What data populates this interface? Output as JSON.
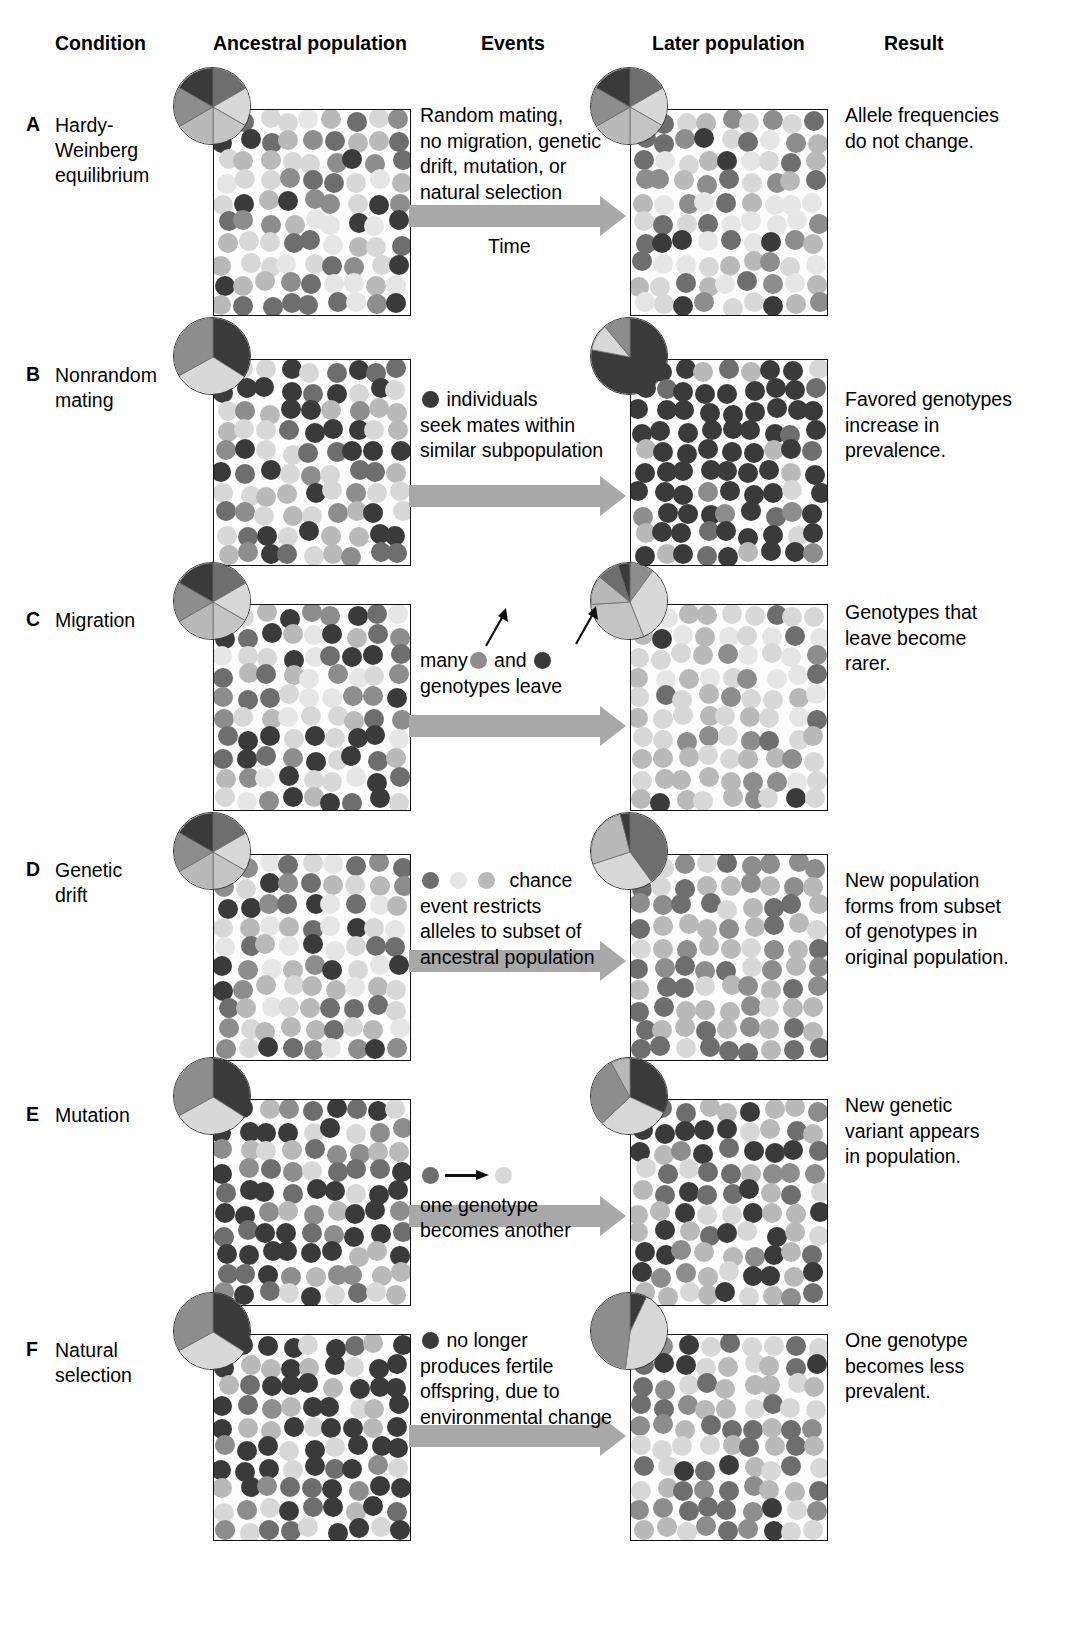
{
  "figure": {
    "columns": [
      {
        "id": "condition",
        "label": "Condition"
      },
      {
        "id": "ancestral",
        "label": "Ancestral population"
      },
      {
        "id": "events",
        "label": "Events"
      },
      {
        "id": "later",
        "label": "Later population"
      },
      {
        "id": "result",
        "label": "Result"
      }
    ]
  },
  "palette": {
    "very_dark": "#3a3a3a",
    "dark": "#555555",
    "mid_dark": "#6e6e6e",
    "mid": "#8d8d8d",
    "light": "#b9b9b9",
    "very_light": "#d8d8d8",
    "pale": "#e6e6e6",
    "arrow_gray": "#a8a8a8",
    "box_border": "#111111",
    "background": "#ffffff",
    "text": "#000000"
  },
  "rows": [
    {
      "letter": "A",
      "condition": "Hardy-\nWeinberg\nequilibrium",
      "events": "Random mating,\nno migration, genetic\ndrift, mutation, or\nnatural selection",
      "time_label": "Time",
      "result": "Allele frequencies\ndo not change.",
      "ancestral_pie": [
        {
          "color": "#6e6e6e",
          "fraction": 0.1667
        },
        {
          "color": "#d8d8d8",
          "fraction": 0.1667
        },
        {
          "color": "#c4c4c4",
          "fraction": 0.1667
        },
        {
          "color": "#b9b9b9",
          "fraction": 0.1667
        },
        {
          "color": "#8d8d8d",
          "fraction": 0.1667
        },
        {
          "color": "#3a3a3a",
          "fraction": 0.1667
        }
      ],
      "later_pie": [
        {
          "color": "#6e6e6e",
          "fraction": 0.1667
        },
        {
          "color": "#d8d8d8",
          "fraction": 0.1667
        },
        {
          "color": "#c4c4c4",
          "fraction": 0.1667
        },
        {
          "color": "#b9b9b9",
          "fraction": 0.1667
        },
        {
          "color": "#8d8d8d",
          "fraction": 0.1667
        },
        {
          "color": "#3a3a3a",
          "fraction": 0.1667
        }
      ],
      "ancestral_mix": {
        "#3a3a3a": 0.16,
        "#6e6e6e": 0.17,
        "#8d8d8d": 0.17,
        "#b9b9b9": 0.17,
        "#d8d8d8": 0.17,
        "#e6e6e6": 0.16
      },
      "later_mix": {
        "#3a3a3a": 0.16,
        "#6e6e6e": 0.17,
        "#8d8d8d": 0.17,
        "#b9b9b9": 0.17,
        "#d8d8d8": 0.17,
        "#e6e6e6": 0.16
      },
      "seed_a": 11,
      "seed_b": 29
    },
    {
      "letter": "B",
      "condition": "Nonrandom\nmating",
      "events_prefix_dot": "#3a3a3a",
      "events": "individuals\nseek mates within\nsimilar subpopulation",
      "result": "Favored genotypes\nincrease in\nprevalence.",
      "ancestral_pie": [
        {
          "color": "#3a3a3a",
          "fraction": 0.34
        },
        {
          "color": "#d8d8d8",
          "fraction": 0.33
        },
        {
          "color": "#8d8d8d",
          "fraction": 0.33
        }
      ],
      "later_pie": [
        {
          "color": "#3a3a3a",
          "fraction": 0.78
        },
        {
          "color": "#d8d8d8",
          "fraction": 0.11
        },
        {
          "color": "#8d8d8d",
          "fraction": 0.11
        }
      ],
      "ancestral_mix": {
        "#3a3a3a": 0.4,
        "#6e6e6e": 0.18,
        "#8d8d8d": 0.12,
        "#b9b9b9": 0.15,
        "#d8d8d8": 0.15
      },
      "later_mix": {
        "#3a3a3a": 0.72,
        "#6e6e6e": 0.1,
        "#8d8d8d": 0.06,
        "#b9b9b9": 0.06,
        "#d8d8d8": 0.06
      },
      "seed_a": 5,
      "seed_b": 41
    },
    {
      "letter": "C",
      "condition": "Migration",
      "events_line1_a": "many",
      "events_line1_dot1": "#8d8d8d",
      "events_line1_b": "and",
      "events_line1_dot2": "#3a3a3a",
      "events": "genotypes leave",
      "result": "Genotypes that\nleave become\nrarer.",
      "ancestral_pie": [
        {
          "color": "#6e6e6e",
          "fraction": 0.1667
        },
        {
          "color": "#d8d8d8",
          "fraction": 0.1667
        },
        {
          "color": "#c4c4c4",
          "fraction": 0.1667
        },
        {
          "color": "#b9b9b9",
          "fraction": 0.1667
        },
        {
          "color": "#8d8d8d",
          "fraction": 0.1667
        },
        {
          "color": "#3a3a3a",
          "fraction": 0.1667
        }
      ],
      "later_pie": [
        {
          "color": "#8d8d8d",
          "fraction": 0.1
        },
        {
          "color": "#d8d8d8",
          "fraction": 0.34
        },
        {
          "color": "#c4c4c4",
          "fraction": 0.3
        },
        {
          "color": "#b9b9b9",
          "fraction": 0.12
        },
        {
          "color": "#6e6e6e",
          "fraction": 0.09
        },
        {
          "color": "#3a3a3a",
          "fraction": 0.05
        }
      ],
      "ancestral_mix": {
        "#3a3a3a": 0.16,
        "#6e6e6e": 0.17,
        "#8d8d8d": 0.17,
        "#b9b9b9": 0.17,
        "#d8d8d8": 0.17,
        "#e6e6e6": 0.16
      },
      "later_mix": {
        "#3a3a3a": 0.05,
        "#6e6e6e": 0.12,
        "#8d8d8d": 0.13,
        "#b9b9b9": 0.24,
        "#d8d8d8": 0.25,
        "#e6e6e6": 0.21
      },
      "seed_a": 17,
      "seed_b": 53
    },
    {
      "letter": "D",
      "condition": "Genetic\ndrift",
      "events_dots": [
        "#6e6e6e",
        "#e6e6e6",
        "#b9b9b9"
      ],
      "events": "chance\nevent restricts\nalleles to subset of\nancestral population",
      "result": "New population\nforms from subset\nof genotypes in\noriginal population.",
      "ancestral_pie": [
        {
          "color": "#6e6e6e",
          "fraction": 0.1667
        },
        {
          "color": "#d8d8d8",
          "fraction": 0.1667
        },
        {
          "color": "#c4c4c4",
          "fraction": 0.1667
        },
        {
          "color": "#b9b9b9",
          "fraction": 0.1667
        },
        {
          "color": "#8d8d8d",
          "fraction": 0.1667
        },
        {
          "color": "#3a3a3a",
          "fraction": 0.1667
        }
      ],
      "later_pie": [
        {
          "color": "#6e6e6e",
          "fraction": 0.4
        },
        {
          "color": "#d8d8d8",
          "fraction": 0.3
        },
        {
          "color": "#b9b9b9",
          "fraction": 0.26
        },
        {
          "color": "#3a3a3a",
          "fraction": 0.04
        }
      ],
      "ancestral_mix": {
        "#3a3a3a": 0.16,
        "#6e6e6e": 0.17,
        "#8d8d8d": 0.17,
        "#b9b9b9": 0.17,
        "#d8d8d8": 0.17,
        "#e6e6e6": 0.16
      },
      "later_mix": {
        "#6e6e6e": 0.34,
        "#8d8d8d": 0.22,
        "#b9b9b9": 0.22,
        "#d8d8d8": 0.22
      },
      "seed_a": 23,
      "seed_b": 67
    },
    {
      "letter": "E",
      "condition": "Mutation",
      "events_mut_from": "#6e6e6e",
      "events_mut_to": "#d8d8d8",
      "events": "one genotype\nbecomes another",
      "result": "New genetic\nvariant appears\nin population.",
      "ancestral_pie": [
        {
          "color": "#3a3a3a",
          "fraction": 0.34
        },
        {
          "color": "#d8d8d8",
          "fraction": 0.33
        },
        {
          "color": "#8d8d8d",
          "fraction": 0.33
        }
      ],
      "later_pie": [
        {
          "color": "#3a3a3a",
          "fraction": 0.32
        },
        {
          "color": "#d8d8d8",
          "fraction": 0.31
        },
        {
          "color": "#8d8d8d",
          "fraction": 0.29
        },
        {
          "color": "#b9b9b9",
          "fraction": 0.08
        }
      ],
      "ancestral_mix": {
        "#3a3a3a": 0.34,
        "#6e6e6e": 0.17,
        "#8d8d8d": 0.16,
        "#b9b9b9": 0.16,
        "#d8d8d8": 0.17
      },
      "later_mix": {
        "#3a3a3a": 0.3,
        "#6e6e6e": 0.17,
        "#8d8d8d": 0.16,
        "#b9b9b9": 0.19,
        "#d8d8d8": 0.18
      },
      "seed_a": 31,
      "seed_b": 71
    },
    {
      "letter": "F",
      "condition": "Natural\nselection",
      "events_prefix_dot": "#3a3a3a",
      "events": "no longer\nproduces fertile\noffspring, due to\nenvironmental change",
      "result": "One genotype\nbecomes less\nprevalent.",
      "ancestral_pie": [
        {
          "color": "#3a3a3a",
          "fraction": 0.34
        },
        {
          "color": "#d8d8d8",
          "fraction": 0.33
        },
        {
          "color": "#8d8d8d",
          "fraction": 0.33
        }
      ],
      "later_pie": [
        {
          "color": "#3a3a3a",
          "fraction": 0.07
        },
        {
          "color": "#d8d8d8",
          "fraction": 0.45
        },
        {
          "color": "#8d8d8d",
          "fraction": 0.48
        }
      ],
      "ancestral_mix": {
        "#3a3a3a": 0.38,
        "#6e6e6e": 0.18,
        "#8d8d8d": 0.14,
        "#b9b9b9": 0.15,
        "#d8d8d8": 0.15
      },
      "later_mix": {
        "#3a3a3a": 0.1,
        "#6e6e6e": 0.26,
        "#8d8d8d": 0.22,
        "#b9b9b9": 0.21,
        "#d8d8d8": 0.21
      },
      "seed_a": 37,
      "seed_b": 83
    }
  ],
  "layout": {
    "header_y": 32,
    "col_x": {
      "condition": 55,
      "ancestral": 215,
      "events": 420,
      "later": 632,
      "result": 845
    },
    "row_tops": [
      95,
      345,
      590,
      840,
      1085,
      1320
    ],
    "box_w": 196,
    "box_h": 205,
    "ancestral_box_x": 213,
    "later_box_x": 630,
    "pie_d": 78
  }
}
